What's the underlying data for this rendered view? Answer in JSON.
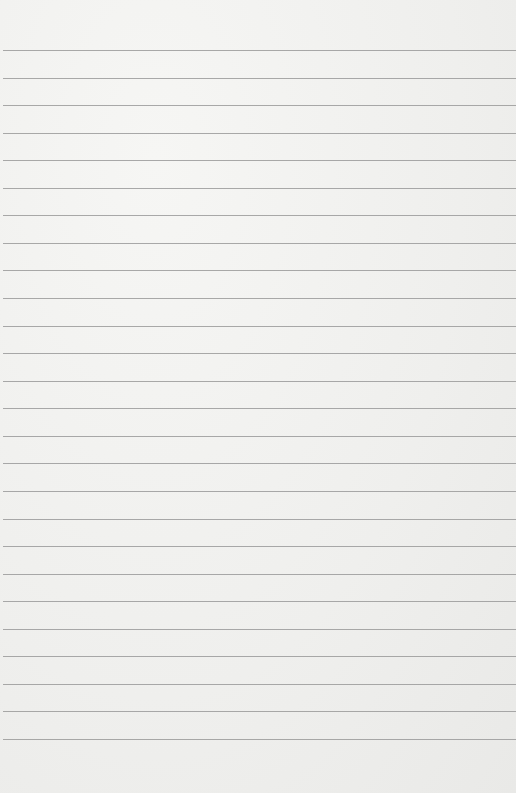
{
  "paper": {
    "type": "lined-paper",
    "background_color": "#efefed",
    "line_color": "#9a9a9a",
    "first_line_y": 50,
    "line_spacing": 27.56,
    "line_count": 26
  }
}
